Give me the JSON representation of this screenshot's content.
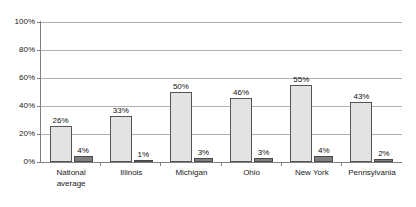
{
  "chart_data": {
    "type": "bar",
    "title": "",
    "subtitle": "",
    "xlabel": "",
    "ylabel": "",
    "ylim": [
      0,
      100
    ],
    "yticks": [
      "0%",
      "20%",
      "40%",
      "60%",
      "80%",
      "100%"
    ],
    "ytick_values": [
      0,
      20,
      40,
      60,
      80,
      100
    ],
    "grid": true,
    "legend": "none",
    "value_suffix": "%",
    "categories": [
      "National average",
      "Illinois",
      "Michigan",
      "Ohio",
      "New York",
      "Pennsylvania"
    ],
    "category_lines": [
      [
        "National",
        "average"
      ],
      [
        "Illinois"
      ],
      [
        "Michigan"
      ],
      [
        "Ohio"
      ],
      [
        "New York"
      ],
      [
        "Pennsylvania"
      ]
    ],
    "series": [
      {
        "name": "series-1",
        "color": "#e3e3e3",
        "border_color": "#555555",
        "values": [
          26,
          33,
          50,
          46,
          55,
          43
        ],
        "labels": [
          "26%",
          "33%",
          "50%",
          "46%",
          "55%",
          "43%"
        ]
      },
      {
        "name": "series-2",
        "color": "#808080",
        "border_color": "#4a4a4a",
        "values": [
          4,
          1,
          3,
          3,
          4,
          2
        ],
        "labels": [
          "4%",
          "1%",
          "3%",
          "3%",
          "4%",
          "2%"
        ]
      }
    ],
    "colors": {
      "plot_background": "#ffffff",
      "gridline": "#b0b0b0",
      "axis": "#808080",
      "text": "#1a1a1a"
    }
  }
}
